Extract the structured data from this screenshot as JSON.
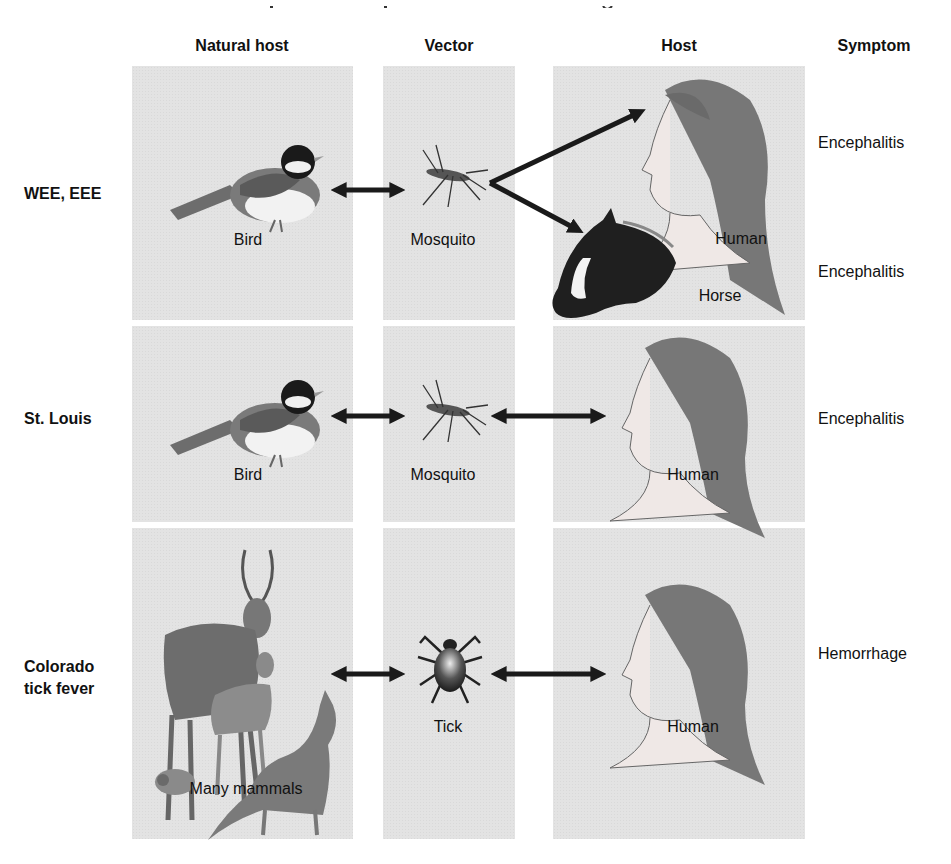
{
  "headers": {
    "natural_host": "Natural host",
    "vector": "Vector",
    "host": "Host",
    "symptom": "Symptom"
  },
  "rows": [
    {
      "label": "WEE, EEE",
      "natural_host": "Bird",
      "vector": "Mosquito",
      "hosts": [
        "Human",
        "Horse"
      ],
      "symptoms": [
        "Encephalitis",
        "Encephalitis"
      ]
    },
    {
      "label": "St. Louis",
      "natural_host": "Bird",
      "vector": "Mosquito",
      "hosts": [
        "Human"
      ],
      "symptoms": [
        "Encephalitis"
      ]
    },
    {
      "label_line1": "Colorado",
      "label_line2": "tick fever",
      "natural_host": "Many mammals",
      "vector": "Tick",
      "hosts": [
        "Human"
      ],
      "symptoms": [
        "Hemorrhage"
      ]
    }
  ],
  "colors": {
    "panel": "#e3e3e3",
    "arrow": "#1a1a1a"
  }
}
